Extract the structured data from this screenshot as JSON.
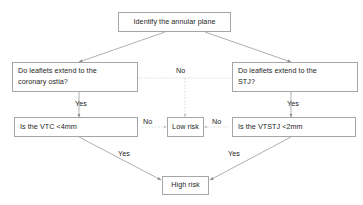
{
  "diagram": {
    "title_node": {
      "label": "Identify the annular plane"
    },
    "nodes": [
      {
        "id": "annular",
        "label": "Identify the annular plane"
      },
      {
        "id": "leaflets_coronary_l1",
        "label": "Do leaflets extend to the"
      },
      {
        "id": "leaflets_coronary_l2",
        "label": "coronary ostia?"
      },
      {
        "id": "leaflets_stj_l1",
        "label": "Do leaflets extend to the"
      },
      {
        "id": "leaflets_stj_l2",
        "label": "STJ?"
      },
      {
        "id": "vtc",
        "label": "Is the VTC <4mm"
      },
      {
        "id": "vtstj",
        "label": "Is the VTSTJ <2mm"
      },
      {
        "id": "low_risk",
        "label": "Low risk"
      },
      {
        "id": "high_risk",
        "label": "High risk"
      }
    ],
    "edge_labels": {
      "no_top_center": "No",
      "yes_left": "Yes",
      "yes_right": "Yes",
      "no_left_of_lowrisk": "No",
      "no_right_of_lowrisk": "No",
      "yes_left_diagonal": "Yes",
      "yes_right_diagonal": "Yes"
    },
    "colors": {
      "border": "#a6a6a6",
      "text": "#262626",
      "connector_solid": "#8c8c8c",
      "connector_dotted": "#bfbfbf",
      "background": "#ffffff"
    }
  }
}
